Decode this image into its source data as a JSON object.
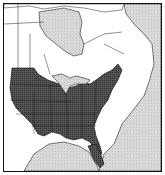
{
  "map": {
    "subject": "Range map of eastern North America",
    "colors": {
      "range": "#4a4a4a",
      "water": "#d4d4d4",
      "land": "#ffffff",
      "border": "#111111"
    },
    "regions": [
      {
        "name": "range-area",
        "description": "Eastern and central United States, shaded dark"
      },
      {
        "name": "hudson-bay",
        "description": "Water body, stippled grey"
      },
      {
        "name": "atlantic-ocean",
        "description": "Water body, stippled grey"
      },
      {
        "name": "gulf-of-mexico",
        "description": "Water body, stippled grey"
      },
      {
        "name": "great-lakes",
        "description": "Water bodies, stippled grey"
      }
    ]
  }
}
